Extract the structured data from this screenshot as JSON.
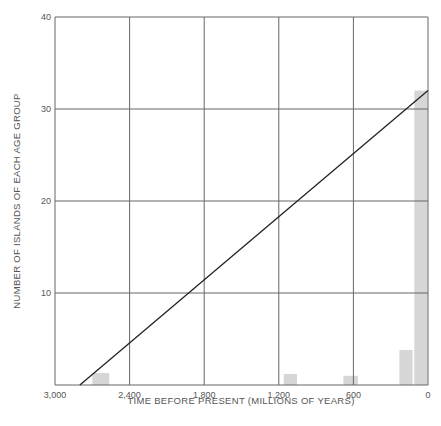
{
  "chart_data": {
    "type": "bar",
    "title": "",
    "xlabel": "TIME BEFORE PRESENT (MILLIONS OF YEARS)",
    "ylabel": "NUMBER OF ISLANDS OF EACH AGE GROUP",
    "xlim": [
      3000,
      0
    ],
    "ylim": [
      0,
      40
    ],
    "x_ticks": [
      3000,
      2400,
      1800,
      1200,
      600,
      0
    ],
    "x_tick_labels": [
      "3,000",
      "2,400",
      "1,800",
      "1,200",
      "600",
      "0"
    ],
    "y_ticks": [
      10,
      20,
      30,
      40
    ],
    "y_tick_labels": [
      "10",
      "20",
      "30",
      "40"
    ],
    "grid": true,
    "legend": null,
    "bars": [
      {
        "x_start": 2700,
        "x_end": 2560,
        "value": 1.3
      },
      {
        "x_start": 1160,
        "x_end": 1050,
        "value": 1.2
      },
      {
        "x_start": 680,
        "x_end": 560,
        "value": 1.0
      },
      {
        "x_start": 230,
        "x_end": 120,
        "value": 3.8
      },
      {
        "x_start": 110,
        "x_end": 0,
        "value": 32
      }
    ],
    "trend_line": {
      "x": [
        2800,
        0
      ],
      "y": [
        0,
        32
      ]
    },
    "colors": {
      "bars": "#d6d6d6",
      "grid": "#666666",
      "line": "#222222"
    }
  }
}
